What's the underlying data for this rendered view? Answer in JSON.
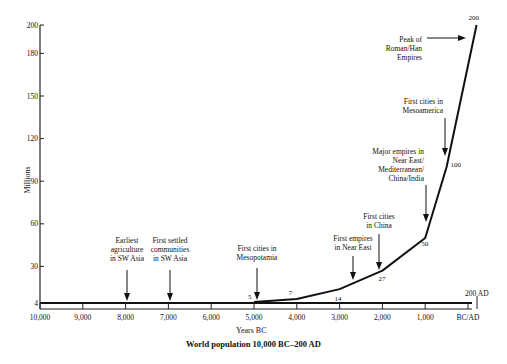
{
  "chart_data": {
    "type": "line",
    "title": "World population 10,000 BC–200 AD",
    "xlabel": "Years BC",
    "ylabel": "Millions",
    "x_ticks": [
      "10,000",
      "9,000",
      "8,000",
      "7,000",
      "6,000",
      "5,000",
      "4,000",
      "3,000",
      "2,000",
      "1,000",
      "BC/AD"
    ],
    "y_ticks": [
      "4",
      "30",
      "60",
      "90",
      "120",
      "150",
      "180",
      "200"
    ],
    "xlim": [
      -10000,
      200
    ],
    "ylim": [
      0,
      200
    ],
    "grid": false,
    "end_marker_label": "200 AD",
    "series": [
      {
        "name": "World population (millions)",
        "x": [
          -10000,
          -5000,
          -4000,
          -3000,
          -2000,
          -1000,
          -500,
          200
        ],
        "values": [
          4,
          5,
          7,
          14,
          27,
          50,
          100,
          200
        ]
      }
    ],
    "data_labels": [
      {
        "x": -5000,
        "label": "5"
      },
      {
        "x": -4000,
        "label": "7"
      },
      {
        "x": -3000,
        "label": "14"
      },
      {
        "x": -2000,
        "label": "27"
      },
      {
        "x": -1000,
        "label": "50"
      },
      {
        "x": -500,
        "label": "100"
      },
      {
        "x": 200,
        "label": "200"
      }
    ],
    "annotations": [
      {
        "x": -8000,
        "lines": [
          "Earliest",
          "agriculture",
          "in SW Asia"
        ]
      },
      {
        "x": -7000,
        "lines": [
          "First settled",
          "communities",
          "in SW Asia"
        ]
      },
      {
        "x": -4800,
        "lines": [
          "First cities in",
          "Mesopotamia"
        ]
      },
      {
        "x": -2500,
        "lines": [
          "First empires",
          "in Near East"
        ]
      },
      {
        "x": -1900,
        "lines": [
          "First cities",
          "in China"
        ]
      },
      {
        "x": -900,
        "lines": [
          "Major empires in",
          "Near East/",
          "Mediterranean/",
          "China/India"
        ]
      },
      {
        "x": -600,
        "lines": [
          "First cities in",
          "Mesoamerica"
        ]
      },
      {
        "x": 100,
        "lines": [
          "Peak of",
          "Roman/Han",
          "Empires"
        ]
      }
    ]
  }
}
